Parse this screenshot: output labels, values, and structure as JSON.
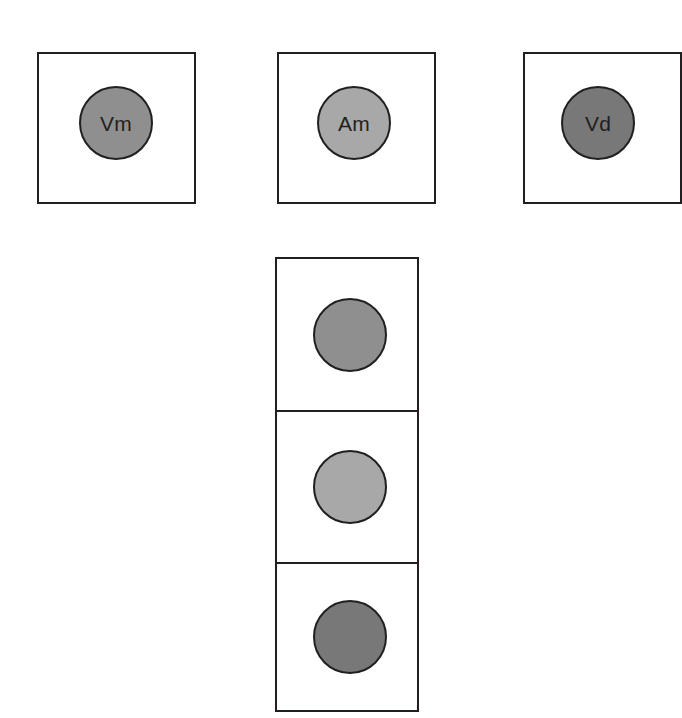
{
  "diagram": {
    "background_color": "#ffffff",
    "stroke_color": "#231f20",
    "palette": {
      "medium_gray": "#8f8f8f",
      "light_gray": "#a8a8a8",
      "dark_gray": "#787878"
    },
    "top_row": {
      "name": "labeled-compartment-row",
      "boxes": [
        {
          "id": "box-vm",
          "label": "Vm",
          "fill": "#8f8f8f",
          "box": {
            "x": 37,
            "y": 52,
            "w": 159,
            "h": 152
          },
          "circle": {
            "cx": 116,
            "cy": 123,
            "r": 37
          }
        },
        {
          "id": "box-am",
          "label": "Am",
          "fill": "#a8a8a8",
          "box": {
            "x": 277,
            "y": 52,
            "w": 159,
            "h": 152
          },
          "circle": {
            "cx": 354,
            "cy": 123,
            "r": 37
          }
        },
        {
          "id": "box-vd",
          "label": "Vd",
          "fill": "#787878",
          "box": {
            "x": 523,
            "y": 52,
            "w": 159,
            "h": 152
          },
          "circle": {
            "cx": 598,
            "cy": 123,
            "r": 37
          }
        }
      ]
    },
    "stack": {
      "name": "stacked-compartment-column",
      "box": {
        "x": 275,
        "y": 257,
        "w": 144,
        "h": 455
      },
      "divider_offsets": [
        153,
        305
      ],
      "cells": [
        {
          "id": "stack-cell-top",
          "label": "",
          "fill": "#8f8f8f",
          "circle": {
            "cx": 350,
            "cy": 335,
            "r": 37
          }
        },
        {
          "id": "stack-cell-middle",
          "label": "",
          "fill": "#a8a8a8",
          "circle": {
            "cx": 350,
            "cy": 487,
            "r": 37
          }
        },
        {
          "id": "stack-cell-bottom",
          "label": "",
          "fill": "#787878",
          "circle": {
            "cx": 350,
            "cy": 637,
            "r": 37
          }
        }
      ]
    }
  }
}
